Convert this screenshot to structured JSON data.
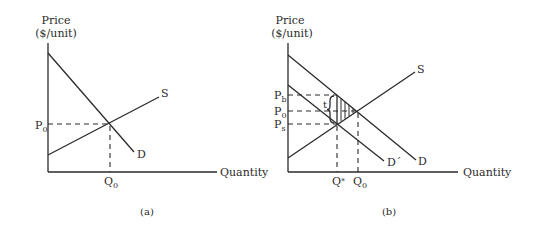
{
  "panels": [
    {
      "id": "a",
      "caption": "(a)",
      "y_axis_label_line1": "Price",
      "y_axis_label_line2": "($/unit)",
      "x_axis_label": "Quantity",
      "curves": {
        "supply": "S",
        "demand": "D"
      },
      "price_labels": {
        "equilibrium": "P",
        "equilibrium_sub": "0"
      },
      "quantity_labels": {
        "equilibrium": "Q",
        "equilibrium_sub": "0"
      }
    },
    {
      "id": "b",
      "caption": "(b)",
      "y_axis_label_line1": "Price",
      "y_axis_label_line2": "($/unit)",
      "x_axis_label": "Quantity",
      "curves": {
        "supply": "S",
        "demand": "D",
        "demand_shifted": "D´"
      },
      "price_labels": {
        "buyer": "P",
        "buyer_sub": "b",
        "equilibrium": "P",
        "equilibrium_sub": "0",
        "seller": "P",
        "seller_sub": "s"
      },
      "quantity_labels": {
        "tax": "Q",
        "tax_sub": "*",
        "equilibrium": "Q",
        "equilibrium_sub": "0"
      },
      "tax_label": "t"
    }
  ],
  "colors": {
    "ink": "#2a2a2a",
    "background": "#ffffff"
  }
}
